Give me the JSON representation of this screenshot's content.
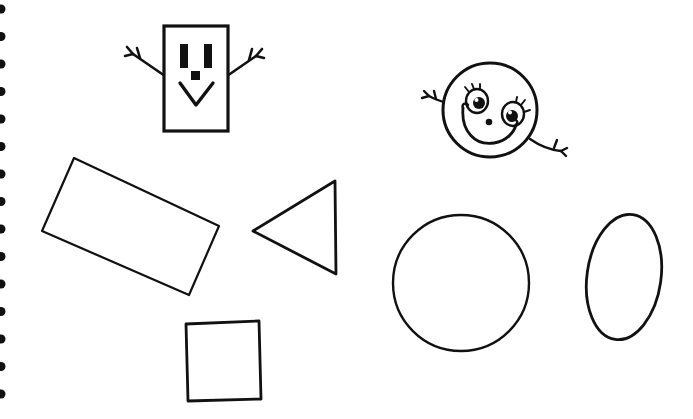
{
  "page": {
    "width": 693,
    "height": 419,
    "background_color": "#ffffff",
    "ink_color": "#111111"
  },
  "binding": {
    "name": "spiral-binding",
    "hole_color": "#111111",
    "hole_count": 15,
    "first_hole_y": 9,
    "hole_spacing": 27.5,
    "hole_radius": 4.5,
    "edge_x": 0
  },
  "figures": [
    {
      "id": "rectangle-character",
      "label": "Rectangle face character",
      "shape": "rectangle",
      "x": 164,
      "y": 26,
      "width": 64,
      "height": 105,
      "stroke_width": 3.2,
      "features": {
        "left_eye": {
          "x": 180,
          "y": 44,
          "width": 8,
          "height": 24
        },
        "right_eye": {
          "x": 203,
          "y": 44,
          "width": 8,
          "height": 24
        },
        "nose": {
          "x": 192,
          "y": 70,
          "width": 9,
          "height": 9
        },
        "mouth": {
          "type": "v-shape",
          "points": "181,84 197,104 213,84"
        },
        "left_arm": {
          "from": "165,74",
          "to": "133,54",
          "fingers": 3
        },
        "right_arm": {
          "from": "227,74",
          "to": "256,56",
          "fingers": 3
        }
      }
    },
    {
      "id": "circle-character",
      "label": "Smiling circle face character",
      "shape": "circle",
      "cx": 490,
      "cy": 110,
      "r": 47,
      "stroke_width": 3.0,
      "features": {
        "left_eye": {
          "cx": 477,
          "cy": 100,
          "rx": 11,
          "ry": 12,
          "pupil_r": 5.5,
          "lashes": 3
        },
        "right_eye": {
          "cx": 513,
          "cy": 113,
          "rx": 11,
          "ry": 12,
          "pupil_r": 5.5,
          "lashes": 3
        },
        "nose": {
          "cx": 490,
          "cy": 121,
          "r": 3.2
        },
        "mouth": {
          "type": "smile-curve"
        },
        "left_arm": {
          "from": "445,104",
          "to": "428,96",
          "fingers": 3
        },
        "right_arm": {
          "from": "532,140",
          "to": "562,150",
          "fingers": 3
        }
      }
    },
    {
      "id": "tilted-rectangle",
      "label": "Tilted rectangle",
      "shape": "quadrilateral",
      "points": "74,158 219,226 189,295 42,231",
      "stroke_width": 2.2
    },
    {
      "id": "triangle",
      "label": "Left-pointing triangle",
      "shape": "triangle",
      "points": "253,231 335,181 336,274",
      "stroke_width": 2.8
    },
    {
      "id": "square",
      "label": "Square",
      "shape": "quadrilateral",
      "points": "186,324 259,321 261,399 188,401",
      "stroke_width": 2.8
    },
    {
      "id": "circle",
      "label": "Circle",
      "shape": "circle",
      "cx": 461,
      "cy": 283,
      "r": 68,
      "stroke_width": 2.4
    },
    {
      "id": "ellipse",
      "label": "Ellipse",
      "shape": "ellipse",
      "cx": 624,
      "cy": 277,
      "rx": 37,
      "ry": 63,
      "rotation": 8,
      "stroke_width": 2.8
    }
  ]
}
